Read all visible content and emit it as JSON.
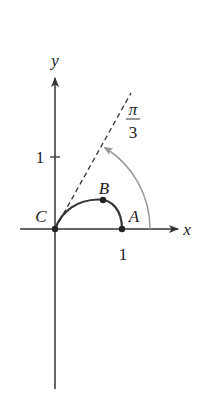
{
  "diagram": {
    "axes": {
      "x_label": "x",
      "y_label": "y",
      "x_tick_label": "1",
      "y_tick_label": "1"
    },
    "points": [
      {
        "name": "A",
        "label": "A",
        "position": "(1, 0)"
      },
      {
        "name": "B",
        "label": "B",
        "position": "top of curve"
      },
      {
        "name": "C",
        "label": "C",
        "position": "origin"
      }
    ],
    "angle": {
      "numerator": "π",
      "denominator": "3"
    },
    "colors": {
      "axis": "#333333",
      "curve": "#333333",
      "angle_arc": "#999999",
      "dashed_ray": "#333333"
    }
  }
}
